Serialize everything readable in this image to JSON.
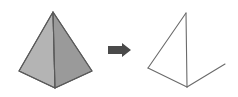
{
  "canvas": {
    "width": 238,
    "height": 97,
    "background_color": "#ffffff"
  },
  "colors": {
    "face_light": "#b4b4b4",
    "face_dark": "#9a9a9a",
    "edge_stroke": "#5a5a5a",
    "wire_stroke": "#6a6a6a",
    "arrow_fill": "#4a4a4a",
    "background": "#ffffff"
  },
  "left_shape": {
    "name": "shaded-pyramid",
    "type": "solid-polygon-3d",
    "fill_left": "#b4b4b4",
    "fill_right": "#9a9a9a",
    "stroke": "#5a5a5a",
    "stroke_width": 1.1,
    "vertices": {
      "apex": [
        53,
        12
      ],
      "base_left": [
        19,
        71
      ],
      "base_right": [
        92,
        71
      ],
      "front_bottom": [
        55,
        88
      ]
    },
    "face_left_points": "53,12 19,71 55,88",
    "face_right_points": "53,12 55,88 92,71",
    "outline_points": "53,12 19,71 55,88 92,71",
    "front_edge": [
      [
        53,
        12
      ],
      [
        55,
        88
      ]
    ]
  },
  "arrow": {
    "name": "transformation-arrow",
    "direction": "right",
    "fill": "#4a4a4a",
    "points": "108,46 122,46 122,43 131,50 122,57 122,54 108,54",
    "bounds": [
      108,
      43,
      23,
      14
    ]
  },
  "right_shape": {
    "name": "wireframe-net",
    "type": "line-outline",
    "stroke": "#6a6a6a",
    "stroke_width": 1.1,
    "fill": "none",
    "vertices": {
      "top": [
        186,
        13
      ],
      "left": [
        148,
        68
      ],
      "bottom": [
        187,
        87
      ],
      "flap_tip": [
        225,
        64
      ]
    },
    "segments": [
      {
        "name": "top-to-left-edge",
        "from": [
          186,
          13
        ],
        "to": [
          148,
          68
        ]
      },
      {
        "name": "left-to-bottom-edge",
        "from": [
          148,
          68
        ],
        "to": [
          187,
          87
        ]
      },
      {
        "name": "vertical-fold-edge",
        "from": [
          186,
          13
        ],
        "to": [
          187,
          87
        ]
      },
      {
        "name": "bottom-to-flap-edge",
        "from": [
          187,
          87
        ],
        "to": [
          225,
          64
        ]
      }
    ]
  }
}
